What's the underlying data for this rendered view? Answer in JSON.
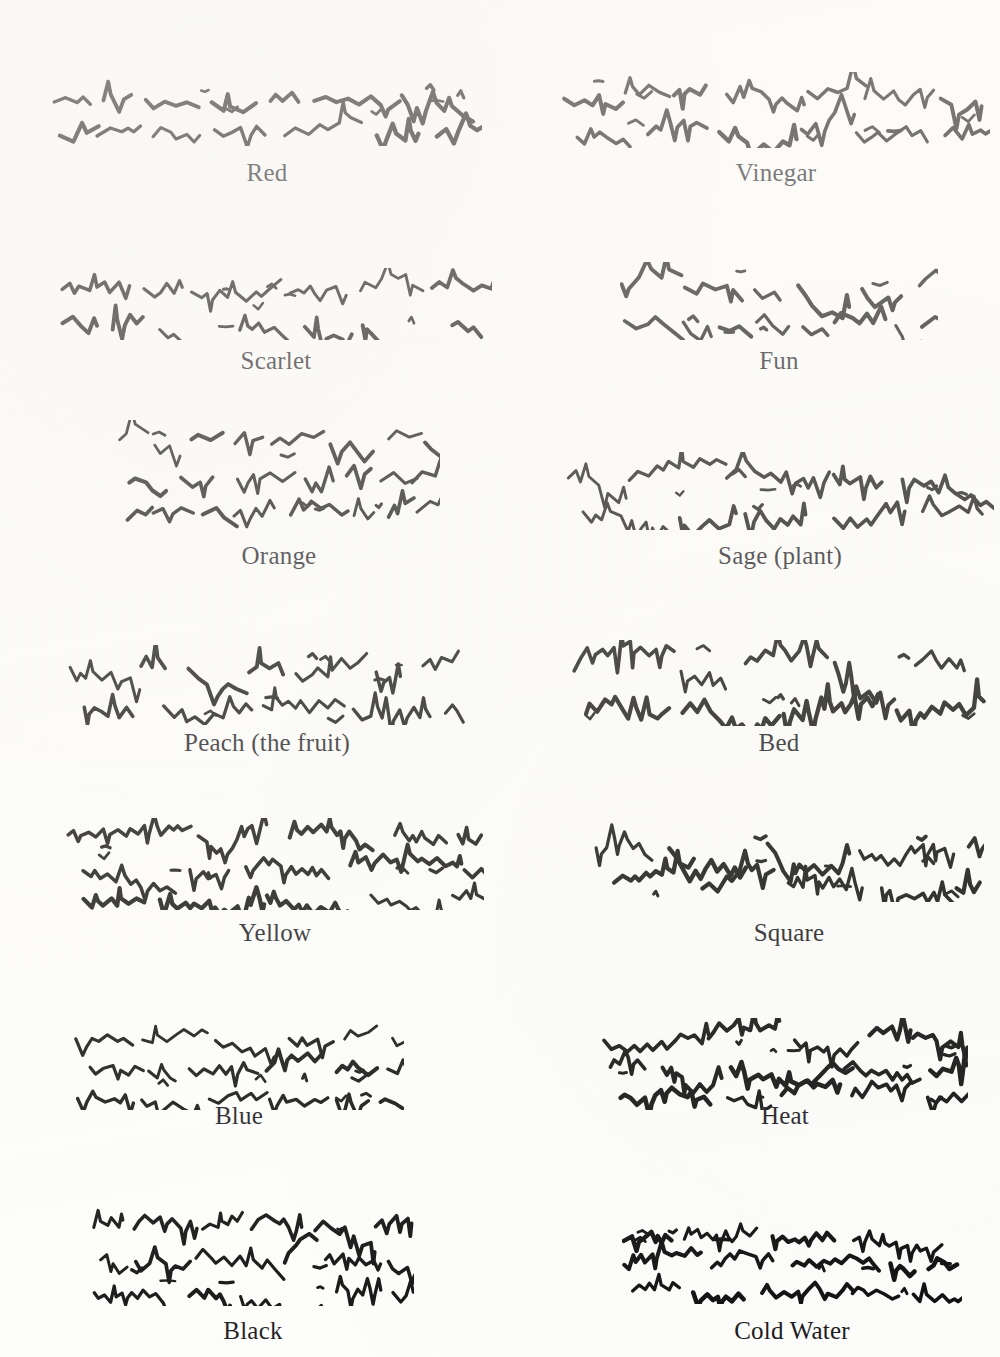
{
  "page": {
    "background_color": "#fdfdfb",
    "ink_color": "#0c0c0c",
    "width": 1000,
    "height": 1357,
    "columns": 2,
    "rows": 7,
    "top_fragment": "",
    "caption_font_size_px": 25
  },
  "samples": [
    {
      "id": "red",
      "label": "Red",
      "column": 0,
      "row": 0,
      "art": {
        "x": 52,
        "y": 78,
        "width": 430,
        "height": 68,
        "seed": 11,
        "strokes": 26,
        "density": "sparse",
        "stroke_width": 3.4,
        "baselines": 2
      },
      "caption": {
        "x": 52,
        "y": 160,
        "width": 430
      }
    },
    {
      "id": "vinegar",
      "label": "Vinegar",
      "column": 1,
      "row": 0,
      "art": {
        "x": 562,
        "y": 72,
        "width": 428,
        "height": 76,
        "seed": 23,
        "strokes": 30,
        "density": "medium",
        "stroke_width": 3.6,
        "baselines": 2
      },
      "caption": {
        "x": 562,
        "y": 160,
        "width": 428
      }
    },
    {
      "id": "scarlet",
      "label": "Scarlet",
      "column": 0,
      "row": 1,
      "art": {
        "x": 60,
        "y": 268,
        "width": 432,
        "height": 72,
        "seed": 37,
        "strokes": 28,
        "density": "medium",
        "stroke_width": 3.2,
        "baselines": 2
      },
      "caption": {
        "x": 60,
        "y": 348,
        "width": 432
      }
    },
    {
      "id": "fun",
      "label": "Fun",
      "column": 1,
      "row": 1,
      "art": {
        "x": 620,
        "y": 262,
        "width": 318,
        "height": 78,
        "seed": 59,
        "strokes": 22,
        "density": "sparse",
        "stroke_width": 3.4,
        "baselines": 2
      },
      "caption": {
        "x": 620,
        "y": 348,
        "width": 318
      }
    },
    {
      "id": "orange",
      "label": "Orange",
      "column": 0,
      "row": 2,
      "art": {
        "x": 118,
        "y": 420,
        "width": 322,
        "height": 110,
        "seed": 71,
        "strokes": 22,
        "density": "sparse",
        "stroke_width": 3.2,
        "baselines": 3
      },
      "caption": {
        "x": 118,
        "y": 543,
        "width": 322
      }
    },
    {
      "id": "sage-plant",
      "label": "Sage (plant)",
      "column": 1,
      "row": 2,
      "art": {
        "x": 566,
        "y": 452,
        "width": 428,
        "height": 78,
        "seed": 83,
        "strokes": 32,
        "density": "medium",
        "stroke_width": 3.2,
        "baselines": 2
      },
      "caption": {
        "x": 566,
        "y": 543,
        "width": 428
      }
    },
    {
      "id": "peach-the-fruit",
      "label": "Peach (the fruit)",
      "column": 0,
      "row": 3,
      "art": {
        "x": 68,
        "y": 645,
        "width": 398,
        "height": 80,
        "seed": 97,
        "strokes": 32,
        "density": "medium",
        "stroke_width": 3.2,
        "baselines": 2
      },
      "caption": {
        "x": 68,
        "y": 730,
        "width": 398
      }
    },
    {
      "id": "bed",
      "label": "Bed",
      "column": 1,
      "row": 3,
      "art": {
        "x": 572,
        "y": 640,
        "width": 414,
        "height": 86,
        "seed": 113,
        "strokes": 34,
        "density": "dense",
        "stroke_width": 3.4,
        "baselines": 2
      },
      "caption": {
        "x": 572,
        "y": 730,
        "width": 414
      }
    },
    {
      "id": "yellow",
      "label": "Yellow",
      "column": 0,
      "row": 4,
      "art": {
        "x": 66,
        "y": 818,
        "width": 418,
        "height": 92,
        "seed": 127,
        "strokes": 34,
        "density": "dense",
        "stroke_width": 3.4,
        "baselines": 3
      },
      "caption": {
        "x": 66,
        "y": 920,
        "width": 418
      }
    },
    {
      "id": "square",
      "label": "Square",
      "column": 1,
      "row": 4,
      "art": {
        "x": 594,
        "y": 822,
        "width": 390,
        "height": 80,
        "seed": 149,
        "strokes": 38,
        "density": "dense",
        "stroke_width": 3.6,
        "baselines": 2
      },
      "caption": {
        "x": 594,
        "y": 920,
        "width": 390
      }
    },
    {
      "id": "blue",
      "label": "Blue",
      "column": 0,
      "row": 5,
      "art": {
        "x": 74,
        "y": 1022,
        "width": 330,
        "height": 88,
        "seed": 163,
        "strokes": 30,
        "density": "medium",
        "stroke_width": 3.2,
        "baselines": 3
      },
      "caption": {
        "x": 74,
        "y": 1103,
        "width": 330
      }
    },
    {
      "id": "heat",
      "label": "Heat",
      "column": 1,
      "row": 5,
      "art": {
        "x": 602,
        "y": 1018,
        "width": 366,
        "height": 92,
        "seed": 181,
        "strokes": 40,
        "density": "dense",
        "stroke_width": 3.6,
        "baselines": 3
      },
      "caption": {
        "x": 602,
        "y": 1103,
        "width": 366
      }
    },
    {
      "id": "black",
      "label": "Black",
      "column": 0,
      "row": 6,
      "art": {
        "x": 92,
        "y": 1208,
        "width": 322,
        "height": 98,
        "seed": 197,
        "strokes": 34,
        "density": "dense",
        "stroke_width": 3.2,
        "baselines": 3
      },
      "caption": {
        "x": 92,
        "y": 1318,
        "width": 322
      }
    },
    {
      "id": "cold-water",
      "label": "Cold Water",
      "column": 1,
      "row": 6,
      "art": {
        "x": 622,
        "y": 1222,
        "width": 340,
        "height": 82,
        "seed": 211,
        "strokes": 36,
        "density": "dense",
        "stroke_width": 3.6,
        "baselines": 3
      },
      "caption": {
        "x": 622,
        "y": 1318,
        "width": 340
      }
    }
  ]
}
